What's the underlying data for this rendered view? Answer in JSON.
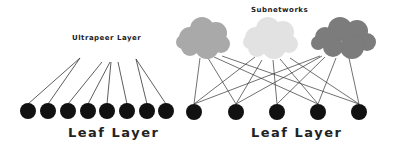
{
  "diagram": {
    "left": {
      "title": "Ultrapeer Layer",
      "bottom_label": "Leaf Layer",
      "leaf_count": 8
    },
    "right": {
      "title": "Subnetworks",
      "bottom_label": "Leaf Layer",
      "leaf_count": 5,
      "clouds": [
        {
          "name": "subnetwork-1",
          "color": "#a9a9a9"
        },
        {
          "name": "subnetwork-2",
          "color": "#e2e2e2"
        },
        {
          "name": "subnetwork-3",
          "color": "#7b7b7b"
        }
      ]
    },
    "colors": {
      "node": "#111111",
      "edge": "#333333",
      "text": "#222222"
    }
  }
}
